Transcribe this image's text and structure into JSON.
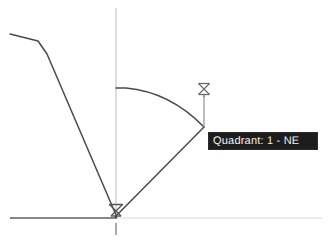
{
  "canvas": {
    "width": 332,
    "height": 243,
    "background": "#ffffff"
  },
  "colors": {
    "geometry_stroke": "#4a4a4a",
    "axis_major": "#6e6e6e",
    "axis_minor": "#c9c9c9",
    "axis_faint": "#e0e0e0",
    "marker_stroke": "#6b6b6b",
    "tooltip_background": "#1d1d1d",
    "tooltip_text": "#f2f2f2",
    "tooltip_border": "#2b2b2b"
  },
  "tooltip": {
    "text": "Quadrant: 1 - NE",
    "quadrant_number": "1",
    "quadrant_name": "NE",
    "x": 208,
    "y": 132,
    "width": 110,
    "height": 18
  },
  "axes": {
    "origin": {
      "x": 116,
      "y": 217
    },
    "vertical": {
      "x": 116,
      "top": 8,
      "bottom": 217,
      "color": "#c9c9c9"
    },
    "vertical_stub": {
      "x": 116,
      "top": 222,
      "bottom": 234,
      "color": "#7a7a7a"
    },
    "horizontal_left": {
      "y": 218,
      "from": 10,
      "to": 116,
      "color": "#5e5e5e"
    },
    "horizontal_right": {
      "y": 218,
      "from": 116,
      "to": 322,
      "color": "#dcdcdc"
    }
  },
  "geometry": {
    "polyline_label": "reference-polyline",
    "polyline_points": "10,34 40,42 48,53 116,215",
    "angle_ray_label": "angle-ray",
    "angle_ray": {
      "x1": 116,
      "y1": 216,
      "x2": 204,
      "y2": 127
    },
    "arc_label": "angle-arc",
    "arc_path": "M 116 88 Q 168 91 204 127",
    "vertex_point": {
      "x": 204,
      "y": 127
    },
    "leader_line": {
      "x1": 204,
      "y1": 127,
      "x2": 204,
      "y2": 95
    }
  },
  "markers": [
    {
      "name": "origin-snap-marker",
      "x": 116,
      "y": 210,
      "glyph": "hourglass-snap-marker"
    },
    {
      "name": "vertex-snap-marker",
      "x": 204,
      "y": 89,
      "glyph": "hourglass-snap-marker"
    }
  ]
}
